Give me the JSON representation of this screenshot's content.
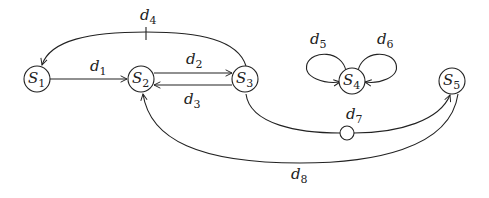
{
  "diagram": {
    "type": "state-transition-graph",
    "nodes": [
      {
        "id": "S1",
        "letter": "S",
        "sub": "1",
        "cx": 37,
        "cy": 79
      },
      {
        "id": "S2",
        "letter": "S",
        "sub": "2",
        "cx": 141,
        "cy": 79
      },
      {
        "id": "S3",
        "letter": "S",
        "sub": "3",
        "cx": 245,
        "cy": 79
      },
      {
        "id": "S4",
        "letter": "S",
        "sub": "4",
        "cx": 352,
        "cy": 81
      },
      {
        "id": "S5",
        "letter": "S",
        "sub": "5",
        "cx": 452,
        "cy": 81
      }
    ],
    "edges": [
      {
        "id": "d1",
        "letter": "d",
        "sub": "1",
        "from": "S1",
        "to": "S2"
      },
      {
        "id": "d2",
        "letter": "d",
        "sub": "2",
        "from": "S2",
        "to": "S3"
      },
      {
        "id": "d3",
        "letter": "d",
        "sub": "3",
        "from": "S3",
        "to": "S2"
      },
      {
        "id": "d4",
        "letter": "d",
        "sub": "4",
        "from": "S3",
        "to": "S1",
        "marker": "tick"
      },
      {
        "id": "d5",
        "letter": "d",
        "sub": "5",
        "from": "S4",
        "to": "S4"
      },
      {
        "id": "d6",
        "letter": "d",
        "sub": "6",
        "from": "S4",
        "to": "S4"
      },
      {
        "id": "d7",
        "letter": "d",
        "sub": "7",
        "from": "S3",
        "to": "S5",
        "marker": "circle"
      },
      {
        "id": "d8",
        "letter": "d",
        "sub": "8",
        "from": "S5",
        "to": "S2"
      }
    ]
  }
}
